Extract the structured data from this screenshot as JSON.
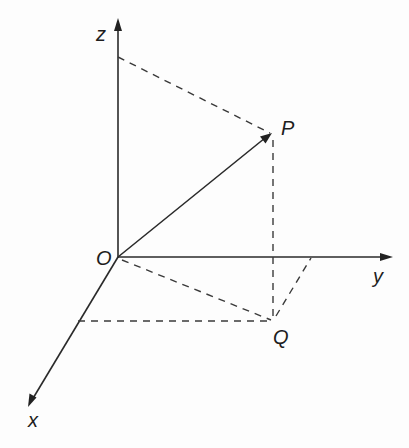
{
  "diagram": {
    "type": "3d-coordinate-axes",
    "colors": {
      "line": "#2a2a2a",
      "background": "#fdfdfd"
    },
    "axes": {
      "x": {
        "label": "x"
      },
      "y": {
        "label": "y"
      },
      "z": {
        "label": "z"
      }
    },
    "points": {
      "origin": {
        "label": "O"
      },
      "P": {
        "label": "P"
      },
      "Q": {
        "label": "Q"
      }
    },
    "edges": [
      {
        "from": "O",
        "to": "P",
        "style": "solid-arrow"
      },
      {
        "from": "z-axis",
        "to": "P",
        "style": "dashed"
      },
      {
        "from": "P",
        "to": "Q",
        "style": "dashed"
      },
      {
        "from": "O",
        "to": "Q",
        "style": "dashed"
      },
      {
        "from": "x-axis",
        "to": "Q",
        "style": "dashed"
      },
      {
        "from": "Q",
        "to": "y-axis",
        "style": "dashed"
      }
    ]
  }
}
